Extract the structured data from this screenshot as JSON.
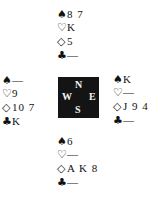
{
  "suits": {
    "spades": "♠",
    "hearts": "♡",
    "diamonds": "◇",
    "clubs": "♣"
  },
  "compass": {
    "north": "N",
    "west": "W",
    "east": "E",
    "south": "S"
  },
  "hands": {
    "north": {
      "spades": "8 7",
      "hearts": "K",
      "diamonds": "5",
      "clubs": "—"
    },
    "west": {
      "spades": "—",
      "hearts": "9",
      "diamonds": "10 7",
      "clubs": "K"
    },
    "east": {
      "spades": "K",
      "hearts": "—",
      "diamonds": "J 9 4",
      "clubs": "—"
    },
    "south": {
      "spades": "6",
      "hearts": "—",
      "diamonds": "A K 8",
      "clubs": "—"
    }
  }
}
